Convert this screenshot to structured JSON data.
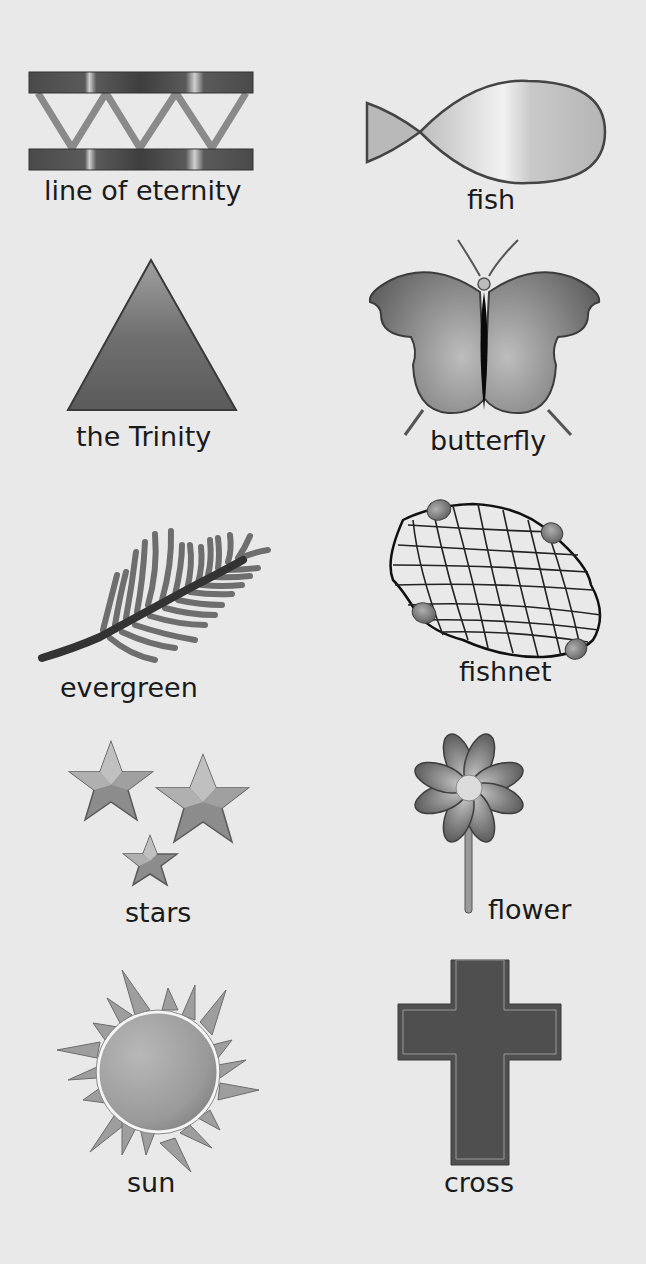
{
  "symbols": [
    {
      "id": "line-of-eternity",
      "label": "line of eternity",
      "icon": "line-of-eternity-icon"
    },
    {
      "id": "fish",
      "label": "fish",
      "icon": "fish-icon"
    },
    {
      "id": "trinity",
      "label": "the Trinity",
      "icon": "triangle-icon"
    },
    {
      "id": "butterfly",
      "label": "butterfly",
      "icon": "butterfly-icon"
    },
    {
      "id": "evergreen",
      "label": "evergreen",
      "icon": "evergreen-branch-icon"
    },
    {
      "id": "fishnet",
      "label": "fishnet",
      "icon": "fishnet-icon"
    },
    {
      "id": "stars",
      "label": "stars",
      "icon": "stars-icon"
    },
    {
      "id": "flower",
      "label": "flower",
      "icon": "flower-icon"
    },
    {
      "id": "sun",
      "label": "sun",
      "icon": "sun-icon"
    },
    {
      "id": "cross",
      "label": "cross",
      "icon": "cross-icon"
    }
  ],
  "colors": {
    "background": "#e9e9e9",
    "dark": "#4a4a4a",
    "mid": "#8a8a8a",
    "light": "#c8c8c8",
    "text": "#1a1a1a"
  }
}
